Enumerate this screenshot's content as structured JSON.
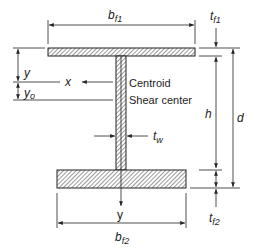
{
  "diagram": {
    "labels": {
      "bf1": "b",
      "bf1_sub": "f1",
      "tf1": "t",
      "tf1_sub": "f1",
      "d": "d",
      "h": "h",
      "tw": "t",
      "tw_sub": "w",
      "tf2": "t",
      "tf2_sub": "f2",
      "bf2": "b",
      "bf2_sub": "f2",
      "y_dist": "y",
      "yo": "y",
      "yo_sub": "o",
      "x_axis": "x",
      "y_axis": "y",
      "centroid": "Centroid",
      "shear_center": "Shear center"
    },
    "colors": {
      "line": "#222222",
      "hatch": "#555555",
      "background": "#ffffff"
    }
  }
}
